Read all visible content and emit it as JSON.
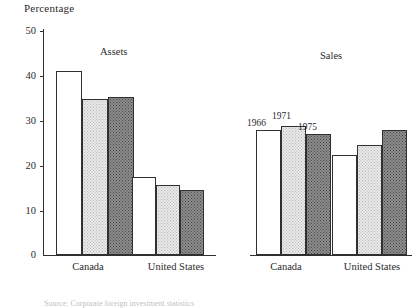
{
  "figure": {
    "y_axis_title": "Percentage",
    "caption": "Source: Corporate foreign investment statistics"
  },
  "chart_data": {
    "type": "bar",
    "title": "Percentage",
    "xlabel": "",
    "ylabel": "Percentage",
    "ylim": [
      0,
      50
    ],
    "yticks": [
      0,
      10,
      20,
      30,
      40,
      50
    ],
    "grid": false,
    "legend_position": "inline-above-bars",
    "legend": [
      "1966",
      "1971",
      "1975"
    ],
    "categories": [
      "Canada",
      "United States"
    ],
    "panels": [
      {
        "title": "Assets",
        "categories": [
          "Canada",
          "United States"
        ],
        "series": [
          {
            "name": "1966",
            "values": [
              41.0,
              17.5
            ]
          },
          {
            "name": "1971",
            "values": [
              34.8,
              15.6
            ]
          },
          {
            "name": "1975",
            "values": [
              35.2,
              14.5
            ]
          }
        ]
      },
      {
        "title": "Sales",
        "categories": [
          "Canada",
          "United States"
        ],
        "series": [
          {
            "name": "1966",
            "values": [
              27.9,
              22.3
            ]
          },
          {
            "name": "1971",
            "values": [
              28.8,
              24.6
            ]
          },
          {
            "name": "1975",
            "values": [
              27.0,
              27.9
            ]
          }
        ]
      }
    ]
  },
  "ticks": {
    "t0": "0",
    "t10": "10",
    "t20": "20",
    "t30": "30",
    "t40": "40",
    "t50": "50"
  },
  "labels": {
    "assets_canada": "Canada",
    "assets_us": "United States",
    "sales_canada": "Canada",
    "sales_us": "United States",
    "assets_panel": "Assets",
    "sales_panel": "Sales",
    "y1966": "1966",
    "y1971": "1971",
    "y1975": "1975"
  },
  "colors": {
    "ink": "#303030",
    "series_1966": "#ffffff",
    "series_1971": "#e9e9e9",
    "series_1975": "#8d8d8d"
  }
}
